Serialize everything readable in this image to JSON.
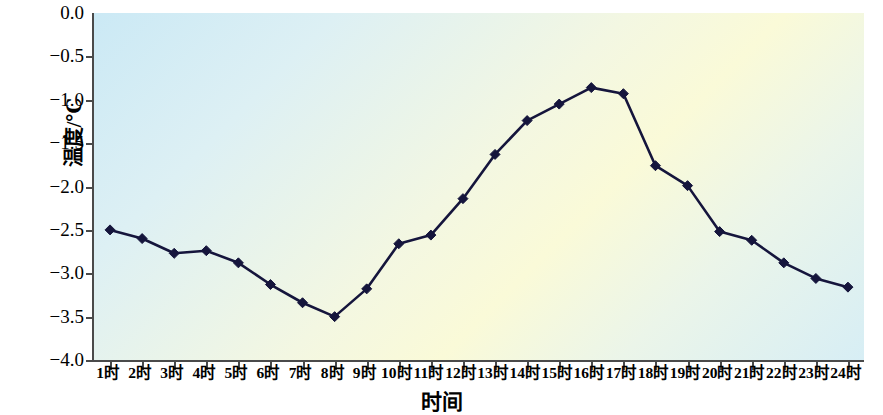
{
  "chart_data": {
    "type": "line",
    "title": "",
    "xlabel": "时间",
    "ylabel": "温度/℃",
    "categories": [
      "1时",
      "2时",
      "3时",
      "4时",
      "5时",
      "6时",
      "7时",
      "8时",
      "9时",
      "10时",
      "11时",
      "12时",
      "13时",
      "14时",
      "15时",
      "16时",
      "17时",
      "18时",
      "19时",
      "20时",
      "21时",
      "22时",
      "23时",
      "24时"
    ],
    "values": [
      -2.5,
      -2.6,
      -2.77,
      -2.74,
      -2.88,
      -3.13,
      -3.34,
      -3.5,
      -3.18,
      -2.66,
      -2.56,
      -2.14,
      -1.63,
      -1.24,
      -1.05,
      -0.86,
      -0.93,
      -1.76,
      -1.99,
      -2.52,
      -2.62,
      -2.88,
      -3.06,
      -3.16
    ],
    "ylim": [
      -4.0,
      0.0
    ],
    "y_ticks": [
      0.0,
      -0.5,
      -1.0,
      -1.5,
      -2.0,
      -2.5,
      -3.0,
      -3.5,
      -4.0
    ],
    "y_tick_labels": [
      "0.0",
      "−0.5",
      "−1.0",
      "−1.5",
      "−2.0",
      "−2.5",
      "−3.0",
      "−3.5",
      "−4.0"
    ],
    "grid": false,
    "legend": null,
    "marker": "diamond",
    "line_color": "#15153c",
    "marker_color": "#15153c",
    "plot_bg_gradient": [
      "#cbe9f5",
      "#fafad8",
      "#d7eef5"
    ],
    "axis_color": "#4a4a4a",
    "series_name": "温度"
  }
}
